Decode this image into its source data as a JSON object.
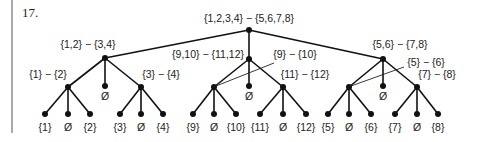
{
  "problem_number": "17.",
  "colors": {
    "ink": "#111111",
    "background": "#ffffff",
    "margin_rule": "#555555"
  },
  "tree": {
    "root": {
      "id": "r",
      "x": 249,
      "y": 30,
      "label": "{1,2,3,4} − {5,6,7,8}",
      "lx": 249,
      "ly": 22,
      "anchor": "middle"
    },
    "internal": [
      {
        "id": "a",
        "parent": "r",
        "x": 105,
        "y": 58,
        "label": "{1,2} − {3,4}",
        "lx": 88,
        "ly": 48,
        "anchor": "middle"
      },
      {
        "id": "b",
        "parent": "r",
        "x": 249,
        "y": 59,
        "label": "{9,10} − {11,12}",
        "lx": 244,
        "ly": 58,
        "anchor": "end"
      },
      {
        "id": "c",
        "parent": "r",
        "x": 383,
        "y": 59,
        "label": "{5,6} − {7,8}",
        "lx": 400,
        "ly": 48,
        "anchor": "middle"
      },
      {
        "id": "a1",
        "parent": "a",
        "x": 68,
        "y": 87,
        "label": "{1} − {2}",
        "lx": 48,
        "ly": 78,
        "anchor": "middle"
      },
      {
        "id": "a3",
        "parent": "a",
        "x": 141,
        "y": 87,
        "label": "{3} − {4}",
        "lx": 161,
        "ly": 78,
        "anchor": "middle"
      },
      {
        "id": "b1",
        "parent": "b",
        "x": 214,
        "y": 87,
        "label": "{9} − {10}",
        "lx": 295,
        "ly": 58,
        "anchor": "middle",
        "pointer": true,
        "px": 274,
        "py": 63
      },
      {
        "id": "b3",
        "parent": "b",
        "x": 283,
        "y": 87,
        "label": "{11} − {12}",
        "lx": 305,
        "ly": 78,
        "anchor": "middle"
      },
      {
        "id": "c1",
        "parent": "c",
        "x": 349,
        "y": 87,
        "label": "{5} − {6}",
        "lx": 426,
        "ly": 66,
        "anchor": "middle",
        "pointer": true,
        "px": 404,
        "py": 67
      },
      {
        "id": "c3",
        "parent": "c",
        "x": 417,
        "y": 87,
        "label": "{7} − {8}",
        "lx": 437,
        "ly": 78,
        "anchor": "middle"
      }
    ],
    "empty_children": [
      {
        "parent": "a",
        "x": 105,
        "y": 86,
        "label": "Ø"
      },
      {
        "parent": "b",
        "x": 249,
        "y": 86,
        "label": "Ø"
      },
      {
        "parent": "c",
        "x": 383,
        "y": 86,
        "label": "Ø"
      }
    ],
    "leaves": [
      {
        "parent": "a1",
        "x": 45,
        "label": "{1}"
      },
      {
        "parent": "a1",
        "x": 68,
        "label": "Ø"
      },
      {
        "parent": "a1",
        "x": 90,
        "label": "{2}"
      },
      {
        "parent": "a3",
        "x": 120,
        "label": "{3}"
      },
      {
        "parent": "a3",
        "x": 141,
        "label": "Ø"
      },
      {
        "parent": "a3",
        "x": 163,
        "label": "{4}"
      },
      {
        "parent": "b1",
        "x": 193,
        "label": "{9}"
      },
      {
        "parent": "b1",
        "x": 214,
        "label": "Ø"
      },
      {
        "parent": "b1",
        "x": 236,
        "label": "{10}"
      },
      {
        "parent": "b3",
        "x": 260,
        "label": "{11}"
      },
      {
        "parent": "b3",
        "x": 283,
        "label": "Ø"
      },
      {
        "parent": "b3",
        "x": 306,
        "label": "{12}"
      },
      {
        "parent": "c1",
        "x": 328,
        "label": "{5}"
      },
      {
        "parent": "c1",
        "x": 349,
        "label": "Ø"
      },
      {
        "parent": "c1",
        "x": 371,
        "label": "{6}"
      },
      {
        "parent": "c3",
        "x": 395,
        "label": "{7}"
      },
      {
        "parent": "c3",
        "x": 417,
        "label": "Ø"
      },
      {
        "parent": "c3",
        "x": 438,
        "label": "{8}"
      }
    ],
    "leaf_y": 114,
    "leaf_label_y": 131
  }
}
